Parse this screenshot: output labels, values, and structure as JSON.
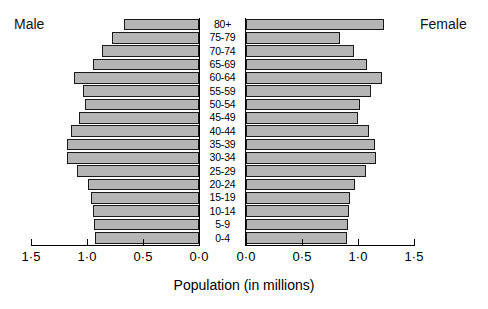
{
  "captions": {
    "male": "Male",
    "female": "Female"
  },
  "axis": {
    "title": "Population (in millions)",
    "male_ticks": [
      "1·5",
      "1·0",
      "0·5",
      "0·0"
    ],
    "female_ticks": [
      "0·0",
      "0·5",
      "1·0",
      "1·5"
    ],
    "male_tick_values": [
      1.5,
      1.0,
      0.5,
      0.0
    ],
    "female_tick_values": [
      0.0,
      0.5,
      1.0,
      1.5
    ]
  },
  "colors": {
    "bar_fill": "#b5b5b5",
    "bar_stroke": "#1a1a1a",
    "background": "#ffffff",
    "text": "#000000"
  },
  "chart_data": {
    "type": "bar",
    "subtype": "population-pyramid",
    "title": "",
    "xlabel": "Population (in millions)",
    "ylabel": "",
    "xlim": [
      0,
      1.5
    ],
    "grid": false,
    "legend_position": "none",
    "categories": [
      "80+",
      "75-79",
      "70-74",
      "65-69",
      "60-64",
      "55-59",
      "50-54",
      "45-49",
      "40-44",
      "35-39",
      "30-34",
      "25-29",
      "20-24",
      "15-19",
      "10-14",
      "5-9",
      "0-4"
    ],
    "series": [
      {
        "name": "Male",
        "direction": "left",
        "values": [
          0.67,
          0.78,
          0.87,
          0.95,
          1.12,
          1.04,
          1.02,
          1.07,
          1.14,
          1.18,
          1.18,
          1.09,
          0.99,
          0.96,
          0.95,
          0.94,
          0.93
        ]
      },
      {
        "name": "Female",
        "direction": "right",
        "values": [
          1.23,
          0.84,
          0.96,
          1.08,
          1.21,
          1.12,
          1.02,
          1.0,
          1.1,
          1.15,
          1.16,
          1.07,
          0.97,
          0.93,
          0.92,
          0.91,
          0.9
        ]
      }
    ]
  }
}
